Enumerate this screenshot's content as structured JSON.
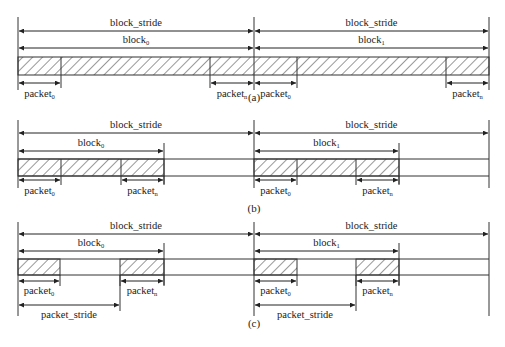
{
  "diagram": {
    "colors": {
      "line": "#333333",
      "hatch": "#444444",
      "background": "#ffffff"
    },
    "panels": [
      {
        "caption": "(a)",
        "variant": "contiguous",
        "blocks": [
          {
            "stride_label": "block_stride",
            "block_label": "block",
            "block_index": "1",
            "packets": [
              {
                "label": "packet",
                "sub": "0"
              },
              {
                "label": "packet",
                "sub": "n"
              }
            ]
          }
        ]
      }
    ],
    "labels": {
      "block_stride": "block_stride",
      "block": "block",
      "packet": "packet",
      "packet_stride": "packet_stride",
      "sub_0": "0",
      "sub_1": "1",
      "sub_n": "n"
    },
    "captions": [
      "(a)",
      "(b)",
      "(c)"
    ],
    "layout": {
      "x_left": 18,
      "x_mid": 254,
      "x_right": 489,
      "rows": [
        {
          "id": "a",
          "caption": "(a)",
          "caption_x": 254,
          "caption_y": 101,
          "top": 17,
          "stride_y": 31,
          "block_y": 48,
          "bar_top": 57,
          "bar_bot": 75,
          "pkt_y": 83,
          "pkt_label_y": 97,
          "bottom": 90,
          "blocks": [
            {
              "start": 18,
              "end": 254,
              "sub": "0",
              "filled_until": 254,
              "packets": [
                {
                  "start": 18,
                  "end": 61,
                  "sub": "0"
                },
                {
                  "start": 210,
                  "end": 254,
                  "sub": "n"
                }
              ]
            },
            {
              "start": 254,
              "end": 489,
              "sub": "1",
              "filled_until": 489,
              "packets": [
                {
                  "start": 254,
                  "end": 297,
                  "sub": "0"
                },
                {
                  "start": 446,
                  "end": 489,
                  "sub": "n"
                }
              ]
            }
          ],
          "hatch_mode": "full"
        },
        {
          "id": "b",
          "caption": "(b)",
          "caption_x": 254,
          "caption_y": 212,
          "top": 120,
          "stride_y": 133,
          "block_y": 151,
          "bar_top": 159,
          "bar_bot": 176,
          "pkt_y": 180,
          "pkt_label_y": 194,
          "bottom": 188,
          "blocks": [
            {
              "start": 18,
              "end": 164,
              "sub": "0",
              "packets": [
                {
                  "start": 18,
                  "end": 61,
                  "sub": "0"
                },
                {
                  "start": 121,
                  "end": 164,
                  "sub": "n"
                }
              ]
            },
            {
              "start": 254,
              "end": 399,
              "sub": "1",
              "packets": [
                {
                  "start": 254,
                  "end": 297,
                  "sub": "0"
                },
                {
                  "start": 356,
                  "end": 399,
                  "sub": "n"
                }
              ]
            }
          ],
          "hatch_mode": "block"
        },
        {
          "id": "c",
          "caption": "(c)",
          "caption_x": 254,
          "caption_y": 327,
          "top": 222,
          "stride_y": 234,
          "block_y": 251,
          "bar_top": 259,
          "bar_bot": 275,
          "pkt_y": 281,
          "pkt_label_y": 294,
          "bottom": 316,
          "blocks": [
            {
              "start": 18,
              "end": 164,
              "sub": "0",
              "packet_stride_end": 120,
              "packet_stride_y": 305,
              "packet_stride_label_y": 318,
              "packets": [
                {
                  "start": 18,
                  "end": 60,
                  "sub": "0"
                },
                {
                  "start": 120,
                  "end": 164,
                  "sub": "n"
                }
              ]
            },
            {
              "start": 254,
              "end": 399,
              "sub": "1",
              "packet_stride_end": 356,
              "packet_stride_y": 305,
              "packet_stride_label_y": 318,
              "packets": [
                {
                  "start": 254,
                  "end": 297,
                  "sub": "0"
                },
                {
                  "start": 356,
                  "end": 399,
                  "sub": "n"
                }
              ]
            }
          ],
          "hatch_mode": "packets"
        }
      ]
    }
  }
}
